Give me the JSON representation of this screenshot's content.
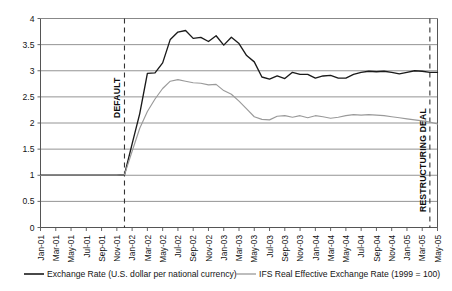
{
  "chart_data": {
    "type": "line",
    "title": "",
    "xlabel": "",
    "ylabel": "",
    "ylim": [
      0,
      4
    ],
    "yticks": [
      0,
      0.5,
      1,
      1.5,
      2,
      2.5,
      3,
      3.5,
      4
    ],
    "ytick_labels": [
      "0",
      "0.5",
      "1",
      "1.5",
      "2",
      "2.5",
      "3",
      "3.5",
      "4"
    ],
    "grid": true,
    "legend_position": "bottom",
    "x": [
      "Jan-01",
      "Feb-01",
      "Mar-01",
      "Apr-01",
      "May-01",
      "Jun-01",
      "Jul-01",
      "Aug-01",
      "Sep-01",
      "Oct-01",
      "Nov-01",
      "Dec-01",
      "Jan-02",
      "Feb-02",
      "Mar-02",
      "Apr-02",
      "May-02",
      "Jun-02",
      "Jul-02",
      "Aug-02",
      "Sep-02",
      "Oct-02",
      "Nov-02",
      "Dec-02",
      "Jan-03",
      "Feb-03",
      "Mar-03",
      "Apr-03",
      "May-03",
      "Jun-03",
      "Jul-03",
      "Aug-03",
      "Sep-03",
      "Oct-03",
      "Nov-03",
      "Dec-03",
      "Jan-04",
      "Feb-04",
      "Mar-04",
      "Apr-04",
      "May-04",
      "Jun-04",
      "Jul-04",
      "Aug-04",
      "Sep-04",
      "Oct-04",
      "Nov-04",
      "Dec-04",
      "Jan-05",
      "Feb-05",
      "Mar-05",
      "Apr-05",
      "May-05"
    ],
    "xtick_labels": [
      "Jan-01",
      "Mar-01",
      "May-01",
      "Jul-01",
      "Sep-01",
      "Nov-01",
      "Jan-02",
      "Mar-02",
      "May-02",
      "Jul-02",
      "Sep-02",
      "Nov-02",
      "Jan-03",
      "Mar-03",
      "May-03",
      "Jul-03",
      "Sep-03",
      "Nov-03",
      "Jan-04",
      "Mar-04",
      "May-04",
      "Jul-04",
      "Sep-04",
      "Nov-04",
      "Jan-05",
      "Mar-05",
      "May-05"
    ],
    "series": [
      {
        "name": "Exchange Rate (U.S. dollar per national currency)",
        "color": "#1a1a1a",
        "values": [
          1.0,
          1.0,
          1.0,
          1.0,
          1.0,
          1.0,
          1.0,
          1.0,
          1.0,
          1.0,
          1.0,
          1.01,
          1.6,
          2.18,
          2.95,
          2.96,
          3.15,
          3.6,
          3.74,
          3.77,
          3.62,
          3.64,
          3.56,
          3.67,
          3.49,
          3.64,
          3.52,
          3.29,
          3.17,
          2.88,
          2.84,
          2.9,
          2.85,
          2.97,
          2.93,
          2.93,
          2.86,
          2.9,
          2.91,
          2.86,
          2.86,
          2.93,
          2.97,
          2.99,
          2.98,
          2.99,
          2.97,
          2.94,
          2.97,
          3.0,
          2.99,
          2.97,
          2.97
        ]
      },
      {
        "name": "IFS Real Effective Exchange Rate (1999 = 100)",
        "color": "#9a9a9a",
        "values": [
          1.0,
          1.0,
          1.0,
          1.0,
          1.0,
          1.0,
          1.0,
          1.0,
          1.0,
          1.0,
          1.0,
          1.01,
          1.46,
          1.9,
          2.22,
          2.46,
          2.66,
          2.8,
          2.83,
          2.8,
          2.77,
          2.76,
          2.73,
          2.74,
          2.62,
          2.55,
          2.42,
          2.27,
          2.12,
          2.07,
          2.06,
          2.13,
          2.14,
          2.11,
          2.14,
          2.1,
          2.14,
          2.12,
          2.09,
          2.11,
          2.14,
          2.16,
          2.15,
          2.16,
          2.15,
          2.14,
          2.12,
          2.1,
          2.08,
          2.06,
          2.04,
          2.02,
          1.98
        ]
      }
    ],
    "annotations": [
      {
        "label": "DEFAULT",
        "x": "Dec-01",
        "style": "dashed-vertical"
      },
      {
        "label": "RESTRUCTURING DEAL",
        "x": "Apr-05",
        "style": "dashed-vertical"
      }
    ]
  },
  "legend": {
    "items": [
      {
        "label": "Exchange Rate (U.S. dollar per national currency)",
        "color": "#1a1a1a"
      },
      {
        "label": "IFS Real Effective Exchange Rate (1999 = 100)",
        "color": "#9a9a9a"
      }
    ]
  }
}
